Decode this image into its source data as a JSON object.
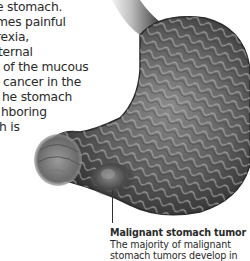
{
  "body_text": {
    "lines": [
      "e stomach.",
      "mes painful",
      "rexia,",
      "ternal",
      " of the mucous",
      " cancer in the",
      "he stomach",
      "hboring",
      "h is"
    ]
  },
  "illustration": {
    "subject": "stomach-cross-section-with-tumor",
    "style": "grayscale anatomical illustration"
  },
  "caption": {
    "title": "Malignant stomach tumor",
    "lines": [
      "The majority of malignant",
      "stomach tumors develop in"
    ]
  },
  "colors": {
    "text": "#2a2a2a",
    "background": "#ffffff",
    "leader_line": "#333333"
  }
}
